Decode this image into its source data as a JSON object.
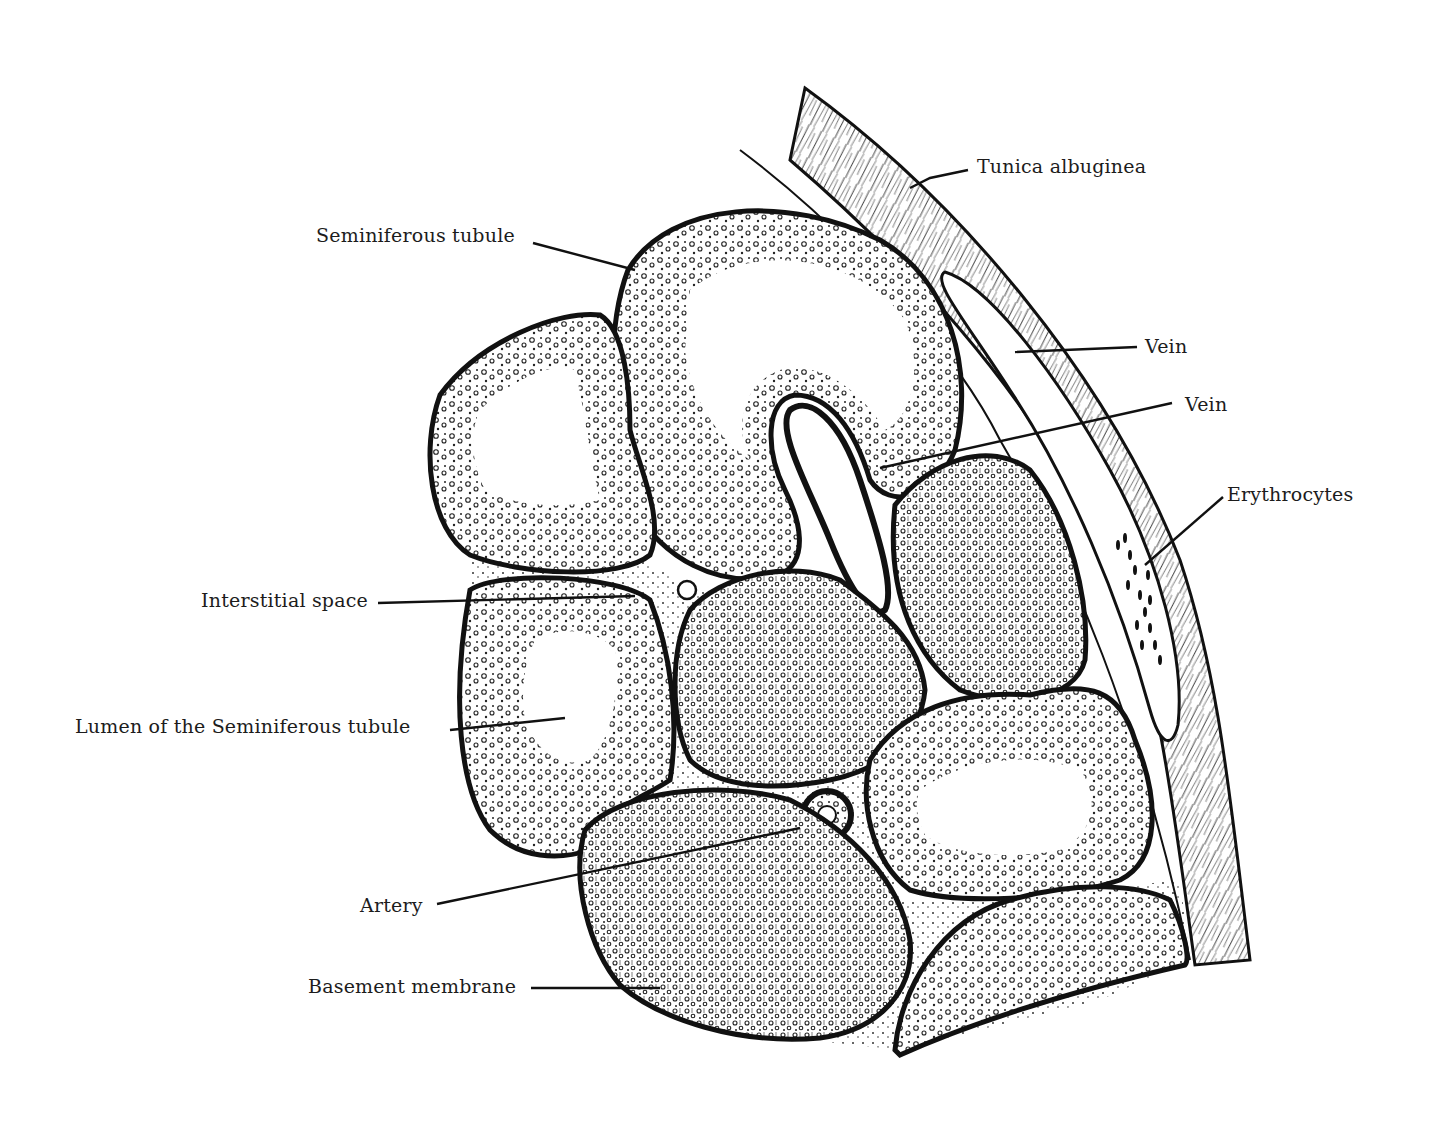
{
  "figure": {
    "ink_color": "#111111",
    "background_color": "#ffffff"
  },
  "labels": {
    "tunica_albuginea": "Tunica albuginea",
    "seminiferous_tubule": "Seminiferous tubule",
    "vein_1": "Vein",
    "vein_2": "Vein",
    "erythrocytes": "Erythrocytes",
    "interstitial_space": "Interstitial space",
    "lumen": "Lumen of the Seminiferous tubule",
    "artery": "Artery",
    "basement_membrane": "Basement membrane"
  }
}
